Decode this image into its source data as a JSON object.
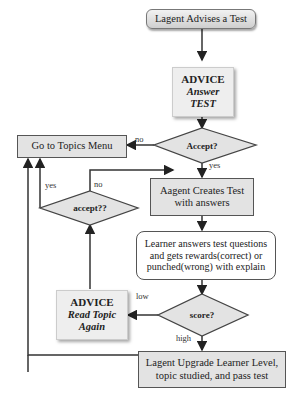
{
  "nodes": {
    "start": "Lagent Advises a Test",
    "advice_test": {
      "title": "ADVICE",
      "line1": "Answer",
      "line2": "TEST"
    },
    "accept_decision": "Accept?",
    "topics_menu": "Go to Topics Menu",
    "create_test": {
      "line1": "Aagent Creates Test",
      "line2": "with  answers"
    },
    "accept2_decision": "accept??",
    "learner_answers": {
      "line1": "Learner answers test questions",
      "line2": "and gets rewards(correct) or",
      "line3": "punched(wrong) with explain"
    },
    "score_decision": "score?",
    "advice_read": {
      "title": "ADVICE",
      "line1": "Read Topic",
      "line2": "Again"
    },
    "upgrade": {
      "line1": "Lagent Upgrade Learner Level,",
      "line2": "topic studied, and pass test"
    }
  },
  "edge_labels": {
    "accept_no": "no",
    "accept_yes": "yes",
    "accept2_yes": "yes",
    "accept2_no": "no",
    "score_low": "low",
    "score_high": "high"
  },
  "colors": {
    "box_fill": "#e3e3e3",
    "line": "#333333",
    "decision_fill": "#e3e3e3"
  }
}
